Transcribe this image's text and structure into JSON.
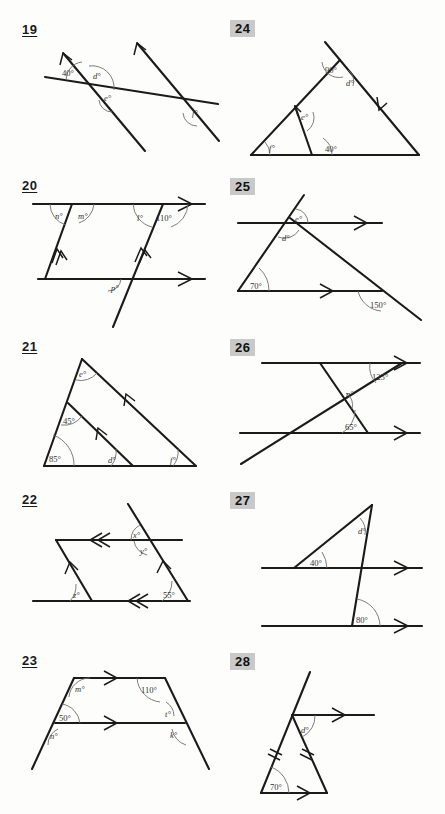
{
  "page": {
    "columns": 2,
    "rows": 5
  },
  "problems": [
    {
      "number": "19",
      "number_style": "underlined",
      "column": "left",
      "figure_type": "two-transversals-crossing-a-line",
      "labels": [
        "40°",
        "d°",
        "e°",
        "f°"
      ],
      "known_angles": [
        "40°"
      ],
      "unknown_angles": [
        "d°",
        "e°",
        "f°"
      ],
      "arrow_marks": 1
    },
    {
      "number": "24",
      "number_style": "boxed",
      "column": "right",
      "figure_type": "triangle-with-interior-cevian",
      "labels": [
        "90°",
        "d°",
        "e°",
        "f°",
        "40°"
      ],
      "known_angles": [
        "90°",
        "40°"
      ],
      "unknown_angles": [
        "d°",
        "e°",
        "f°"
      ],
      "arrow_marks": 2
    },
    {
      "number": "20",
      "number_style": "underlined",
      "column": "left",
      "figure_type": "two-parallel-lines-two-transversals",
      "labels": [
        "n°",
        "m°",
        "l°",
        "110°",
        "p°"
      ],
      "known_angles": [
        "110°"
      ],
      "unknown_angles": [
        "n°",
        "m°",
        "l°",
        "p°"
      ],
      "arrow_marks": 2
    },
    {
      "number": "25",
      "number_style": "boxed",
      "column": "right",
      "figure_type": "triangle-with-parallel-line",
      "labels": [
        "e°",
        "d°",
        "70°",
        "150°"
      ],
      "known_angles": [
        "70°",
        "150°"
      ],
      "unknown_angles": [
        "e°",
        "d°"
      ],
      "arrow_marks": 1
    },
    {
      "number": "21",
      "number_style": "underlined",
      "column": "left",
      "figure_type": "triangle-with-parallel-internal-segment",
      "labels": [
        "e°",
        "45°",
        "85°",
        "d°",
        "f°"
      ],
      "known_angles": [
        "45°",
        "85°"
      ],
      "unknown_angles": [
        "e°",
        "d°",
        "f°"
      ],
      "arrow_marks": 1
    },
    {
      "number": "26",
      "number_style": "boxed",
      "column": "right",
      "figure_type": "two-parallel-lines-crossed-transversals",
      "labels": [
        "125°",
        "p°",
        "65°"
      ],
      "known_angles": [
        "125°",
        "65°"
      ],
      "unknown_angles": [
        "p°"
      ],
      "arrow_marks": 1
    },
    {
      "number": "22",
      "number_style": "underlined",
      "column": "left",
      "figure_type": "parallelogram-with-extended-transversal",
      "labels": [
        "x°",
        "y°",
        "z°",
        "55°"
      ],
      "known_angles": [
        "55°"
      ],
      "unknown_angles": [
        "x°",
        "y°",
        "z°"
      ],
      "arrow_marks": 2
    },
    {
      "number": "27",
      "number_style": "boxed",
      "column": "right",
      "figure_type": "triangle-between-two-parallel-lines",
      "labels": [
        "d°",
        "40°",
        "80°"
      ],
      "known_angles": [
        "40°",
        "80°"
      ],
      "unknown_angles": [
        "d°"
      ],
      "arrow_marks": 1
    },
    {
      "number": "23",
      "number_style": "underlined",
      "column": "left",
      "figure_type": "trapezium-with-parallel-lines",
      "labels": [
        "m°",
        "110°",
        "50°",
        "n°",
        "t°",
        "k°"
      ],
      "known_angles": [
        "110°",
        "50°"
      ],
      "unknown_angles": [
        "m°",
        "n°",
        "t°",
        "k°"
      ],
      "arrow_marks": 1
    },
    {
      "number": "28",
      "number_style": "boxed",
      "column": "right",
      "figure_type": "isosceles-triangle-with-parallel-ray",
      "labels": [
        "d°",
        "70°"
      ],
      "known_angles": [
        "70°"
      ],
      "unknown_angles": [
        "d°"
      ],
      "equal_side_marks": 2,
      "arrow_marks": 1
    }
  ],
  "p19": {
    "a40": "40°",
    "d": "d°",
    "e": "e°",
    "f": "f°"
  },
  "p24": {
    "a90": "90°",
    "d": "d°",
    "e": "e°",
    "f": "f°",
    "a40": "40°"
  },
  "p20": {
    "n": "n°",
    "m": "m°",
    "l": "l°",
    "a110": "110°",
    "p": "p°"
  },
  "p25": {
    "e": "e°",
    "d": "d°",
    "a70": "70°",
    "a150": "150°"
  },
  "p21": {
    "e": "e°",
    "a45": "45°",
    "a85": "85°",
    "d": "d°",
    "f": "f°"
  },
  "p26": {
    "a125": "125°",
    "p": "p°",
    "a65": "65°"
  },
  "p22": {
    "x": "x°",
    "y": "y°",
    "z": "z°",
    "a55": "55°"
  },
  "p27": {
    "d": "d°",
    "a40": "40°",
    "a80": "80°"
  },
  "p23": {
    "m": "m°",
    "a110": "110°",
    "a50": "50°",
    "n": "n°",
    "t": "t°",
    "k": "k°"
  },
  "p28": {
    "d": "d°",
    "a70": "70°"
  },
  "numbers": {
    "n19": "19",
    "n20": "20",
    "n21": "21",
    "n22": "22",
    "n23": "23",
    "n24": "24",
    "n25": "25",
    "n26": "26",
    "n27": "27",
    "n28": "28"
  },
  "colors": {
    "ink": "#1b1b1b",
    "arc": "#6e6e6e",
    "badge_bg": "#c9c9c9",
    "paper": "#fdfdfc"
  }
}
